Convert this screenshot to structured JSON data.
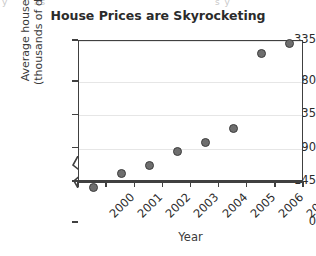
{
  "page": {
    "top_strip_fragments": [
      "y",
      "as",
      "s y"
    ]
  },
  "chart_data": {
    "type": "scatter",
    "title": "House Prices are Skyrocketing",
    "xlabel": "Year",
    "ylabel": "Average house price\n(thousands of dollars)",
    "ylabel_line1": "Average house price",
    "ylabel_line2": "(thousands of dollars)",
    "categories": [
      "2000",
      "2001",
      "2002",
      "2003",
      "2004",
      "2005",
      "2006",
      "2007"
    ],
    "x": [
      2000,
      2001,
      2002,
      2003,
      2004,
      2005,
      2006,
      2007
    ],
    "values": [
      138,
      157,
      167,
      186,
      198,
      217,
      318,
      332
    ],
    "points": [
      {
        "x": "2000",
        "y": 138
      },
      {
        "x": "2001",
        "y": 157
      },
      {
        "x": "2002",
        "y": 167
      },
      {
        "x": "2003",
        "y": 186
      },
      {
        "x": "2004",
        "y": 198
      },
      {
        "x": "2005",
        "y": 217
      },
      {
        "x": "2006",
        "y": 318
      },
      {
        "x": "2007",
        "y": 332
      }
    ],
    "yticks": [
      0,
      145,
      190,
      235,
      280,
      335
    ],
    "ytick_labels": [
      "0",
      "145",
      "190",
      "235",
      "280",
      "335"
    ],
    "ylim": [
      145,
      335
    ],
    "y_axis_break": true,
    "y_axis_break_between": [
      0,
      145
    ],
    "xtick_labels": [
      "2000",
      "2001",
      "2002",
      "2003",
      "2004",
      "2005",
      "2006",
      "2007"
    ],
    "grid": "horizontal",
    "legend": null,
    "marker_color": "#6e6e6e",
    "marker_edge_color": "#3d3d3d",
    "gridline_color": "#e6e6e6",
    "axis_color": "#404040"
  }
}
